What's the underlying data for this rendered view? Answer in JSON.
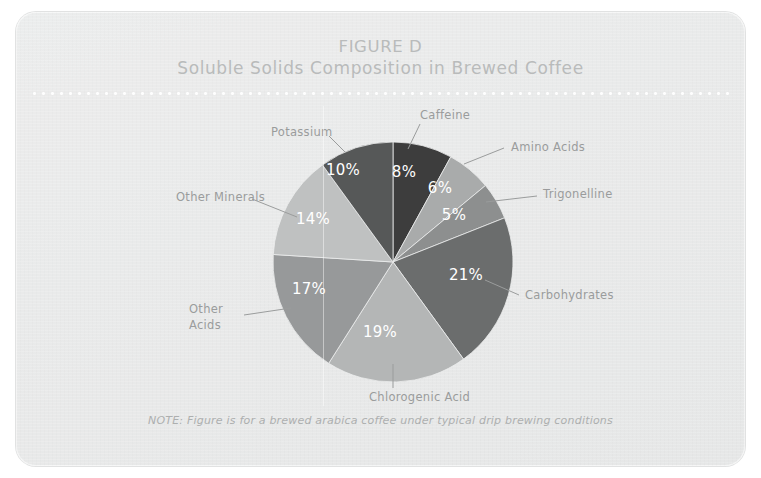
{
  "figure": {
    "title_main": "FIGURE D",
    "title_sub": "Soluble Solids Composition in Brewed Coffee",
    "note": "NOTE: Figure is for a brewed arabica coffee under typical drip brewing conditions",
    "card_background": "#eceded",
    "title_color": "#b9bbbb",
    "label_color": "#9a9c9c",
    "pct_label_color": "#ffffff",
    "divider": "white-dotted-rule"
  },
  "chart_data": {
    "type": "pie",
    "title": "Soluble Solids Composition in Brewed Coffee",
    "subtitle": "FIGURE D",
    "unit": "%",
    "legend": "none-external-leader-labels",
    "start_angle_deg": 0,
    "direction": "clockwise",
    "total": 100,
    "categories": [
      "Caffeine",
      "Amino Acids",
      "Trigonelline",
      "Carbohydrates",
      "Chlorogenic Acid",
      "Other Acids",
      "Other Minerals",
      "Potassium"
    ],
    "values": [
      8,
      6,
      5,
      21,
      19,
      17,
      14,
      10
    ],
    "colors": [
      "#3d3d3d",
      "#a9abab",
      "#8d8f8f",
      "#6b6d6d",
      "#b4b6b6",
      "#97999a",
      "#bfc1c1",
      "#565858"
    ],
    "slices": [
      {
        "label": "Caffeine",
        "value": 8,
        "pct": "8%",
        "color": "#3d3d3d",
        "label_x": 404,
        "label_y": 103,
        "pct_x": 388,
        "pct_y": 160,
        "leader": "M 392 137 L 404 112"
      },
      {
        "label": "Amino Acids",
        "value": 6,
        "pct": "6%",
        "color": "#a9abab",
        "label_x": 495,
        "label_y": 135,
        "pct_x": 424,
        "pct_y": 176,
        "leader": "M 448 152 L 488 136"
      },
      {
        "label": "Trigonelline",
        "value": 5,
        "pct": "5%",
        "color": "#8d8f8f",
        "label_x": 527,
        "label_y": 182,
        "pct_x": 438,
        "pct_y": 203,
        "leader": "M 470 190 L 521 184"
      },
      {
        "label": "Carbohydrates",
        "value": 21,
        "pct": "21%",
        "color": "#6b6d6d",
        "label_x": 509,
        "label_y": 283,
        "pct_x": 450,
        "pct_y": 263,
        "leader": "M 469 268 L 503 283"
      },
      {
        "label": "Chlorogenic Acid",
        "value": 19,
        "pct": "19%",
        "color": "#b4b6b6",
        "label_x": 353,
        "label_y": 385,
        "pct_x": 364,
        "pct_y": 320,
        "leader": "M 377 352 L 377 376"
      },
      {
        "label": "Other Acids",
        "value": 17,
        "pct": "17%",
        "color": "#97999a",
        "label_x": 173,
        "label_y": 305,
        "pct_x": 293,
        "pct_y": 277,
        "leader": "M 275 296 L 228 303"
      },
      {
        "label": "Other Minerals",
        "value": 14,
        "pct": "14%",
        "color": "#bfc1c1",
        "label_x": 160,
        "label_y": 185,
        "pct_x": 297,
        "pct_y": 207,
        "leader": "M 281 205 L 236 187"
      },
      {
        "label": "Potassium",
        "value": 10,
        "pct": "10%",
        "color": "#565858",
        "label_x": 255,
        "label_y": 120,
        "pct_x": 327,
        "pct_y": 158,
        "leader": "M 329 140 L 313 124"
      }
    ],
    "center": {
      "x": 377,
      "y": 250
    },
    "radius": 120
  }
}
